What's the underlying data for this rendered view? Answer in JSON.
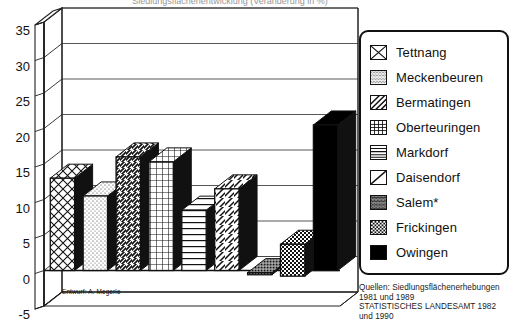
{
  "chart_data": {
    "type": "bar",
    "title": "Siedlungsflächenentwicklung (Veränderung in %)",
    "xlabel": "",
    "ylabel": "",
    "ylim": [
      -5,
      35
    ],
    "ytick_step": 5,
    "yticks": [
      "35",
      "30",
      "25",
      "20",
      "15",
      "10",
      "5",
      "0",
      "-5"
    ],
    "grid": true,
    "legend_position": "right",
    "style": "3d-bar",
    "categories": [
      "Tettnang",
      "Meckenbeuren",
      "Bermatingen",
      "Oberteuringen",
      "Markdorf",
      "Daisendorf",
      "Salem*",
      "Frickingen",
      "Owingen"
    ],
    "values": [
      13.0,
      10.5,
      16.0,
      15.3,
      8.5,
      11.5,
      0.3,
      4.5,
      20.5
    ],
    "bar_bottoms": [
      0,
      0,
      0,
      0,
      0,
      0,
      -0.6,
      -0.8,
      0
    ],
    "patterns": [
      "cross-diagonal",
      "stipple-light",
      "diagonal-hatch",
      "grid",
      "horizontal-lines",
      "diagonal-single",
      "stipple-dark",
      "checkerboard",
      "solid-black"
    ]
  },
  "legend": {
    "items": [
      {
        "label": "Tettnang",
        "pattern": "cross-diagonal"
      },
      {
        "label": "Meckenbeuren",
        "pattern": "stipple-light"
      },
      {
        "label": "Bermatingen",
        "pattern": "diagonal-hatch"
      },
      {
        "label": "Oberteuringen",
        "pattern": "grid"
      },
      {
        "label": "Markdorf",
        "pattern": "horizontal-lines"
      },
      {
        "label": "Daisendorf",
        "pattern": "diagonal-single"
      },
      {
        "label": "Salem*",
        "pattern": "stipple-dark"
      },
      {
        "label": "Frickingen",
        "pattern": "checkerboard"
      },
      {
        "label": "Owingen",
        "pattern": "solid-black"
      }
    ]
  },
  "notes": {
    "sources": "Quellen: Siedlungsflächenerhebungen\n1981 und 1989\nSTATISTISCHES LANDESAMT 1982\nund 1990",
    "credit": "Entwurf: A. Megerle"
  },
  "colors": {
    "ink": "#111111",
    "paper": "#ffffff",
    "solid_bar": "#000000",
    "grid_line": "#555555"
  }
}
